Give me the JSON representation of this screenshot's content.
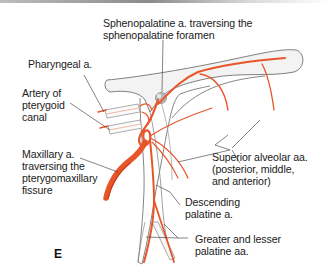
{
  "figure": {
    "panel_letter": "E",
    "colors": {
      "artery": "#e8552a",
      "artery_dark": "#c83d15",
      "bone_outline": "#6e6e6e",
      "bone_fill": "#f2f2f2",
      "leader_line": "#333333",
      "text": "#1a1a1a"
    },
    "labels": {
      "sphenopalatine": [
        "Sphenopalatine a. traversing the",
        "sphenopalatine foramen"
      ],
      "pharyngeal": [
        "Pharyngeal a."
      ],
      "pterygoid_canal": [
        "Artery of",
        "pterygoid",
        "canal"
      ],
      "maxillary": [
        "Maxillary a.",
        "traversing the",
        "pterygomaxillary",
        "fissure"
      ],
      "superior_alveolar": [
        "Superior alveolar aa.",
        "(posterior, middle,",
        "and anterior)"
      ],
      "descending_palatine": [
        "Descending",
        "palatine a."
      ],
      "greater_lesser_palatine": [
        "Greater and lesser",
        "palatine aa."
      ]
    }
  }
}
